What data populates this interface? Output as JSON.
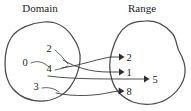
{
  "figure": {
    "type": "mapping-diagram",
    "width": 191,
    "height": 111,
    "background_color": "#ffffff",
    "outline_color": "#4a4a4a",
    "arrow_color": "#3a3a3a",
    "text_color": "#1c1c1c"
  },
  "domain": {
    "title": "Domain",
    "elements": [
      {
        "label": "2",
        "x": 49,
        "y": 52
      },
      {
        "label": "0",
        "x": 25,
        "y": 66
      },
      {
        "label": "4",
        "x": 49,
        "y": 72
      },
      {
        "label": "3",
        "x": 36,
        "y": 90
      }
    ]
  },
  "range": {
    "title": "Range",
    "elements": [
      {
        "label": "2",
        "x": 129,
        "y": 58
      },
      {
        "label": "1",
        "x": 129,
        "y": 73
      },
      {
        "label": "5",
        "x": 155,
        "y": 80
      },
      {
        "label": "8",
        "x": 129,
        "y": 92
      }
    ]
  },
  "mappings": [
    {
      "from": "2",
      "to": "1"
    },
    {
      "from": "0",
      "to": "5"
    },
    {
      "from": "4",
      "to": "2"
    },
    {
      "from": "3",
      "to": "8"
    }
  ]
}
